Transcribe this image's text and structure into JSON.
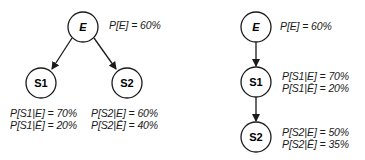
{
  "left_network": {
    "nodes": [
      {
        "id": "E",
        "label": "E",
        "italic": true,
        "cx": 83,
        "cy": 27
      },
      {
        "id": "S1",
        "label": "S1",
        "italic": false,
        "cx": 41,
        "cy": 83
      },
      {
        "id": "S2",
        "label": "S2",
        "italic": false,
        "cx": 127,
        "cy": 83
      }
    ],
    "edges": [
      {
        "from": "E",
        "to": "S1"
      },
      {
        "from": "E",
        "to": "S2"
      }
    ],
    "annotations": {
      "p_e": "P[E] = 60%",
      "s1_given_e": "P[S1|E] = 70%",
      "s1_given_not_e": "P[S1|Ē] = 20%",
      "s2_given_e": "P[S2|E] = 60%",
      "s2_given_not_e": "P[S2|Ē] = 40%"
    }
  },
  "right_network": {
    "nodes": [
      {
        "id": "E",
        "label": "E",
        "italic": true,
        "cx": 256,
        "cy": 27
      },
      {
        "id": "S1",
        "label": "S1",
        "italic": false,
        "cx": 256,
        "cy": 82
      },
      {
        "id": "S2",
        "label": "S2",
        "italic": false,
        "cx": 256,
        "cy": 137
      }
    ],
    "edges": [
      {
        "from": "E",
        "to": "S1"
      },
      {
        "from": "S1",
        "to": "S2"
      }
    ],
    "annotations": {
      "p_e": "P[E] = 60%",
      "s1_given_e": "P[S1|E] = 70%",
      "s1_given_not_e": "P[S1|Ē] = 20%",
      "s2_given_e": "P[S2|E] = 50%",
      "s2_given_not_e": "P[S2|Ē] = 35%"
    }
  }
}
